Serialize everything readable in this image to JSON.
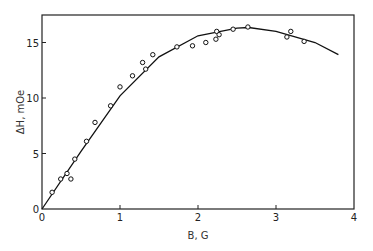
{
  "chart_data": {
    "type": "scatter",
    "title": "",
    "xlabel": "B, G",
    "ylabel": "ΔH, mOe",
    "xlim": [
      0,
      4
    ],
    "ylim": [
      0,
      17
    ],
    "xticks": [
      0,
      1,
      2,
      3,
      4
    ],
    "yticks": [
      0,
      5,
      10,
      15
    ],
    "xtick_labels": [
      "0",
      "1",
      "2",
      "3",
      "4"
    ],
    "ytick_labels": [
      "0",
      "5",
      "10",
      "15"
    ],
    "grid": false,
    "legend": null,
    "series": [
      {
        "name": "measured",
        "kind": "scatter",
        "marker": "open-circle",
        "x": [
          0.13,
          0.24,
          0.32,
          0.37,
          0.42,
          0.57,
          0.68,
          0.88,
          1.0,
          1.16,
          1.29,
          1.33,
          1.42,
          1.73,
          1.93,
          2.1,
          2.23,
          2.24,
          2.27,
          2.45,
          2.64,
          3.14,
          3.19,
          3.36
        ],
        "y": [
          1.5,
          2.7,
          3.2,
          2.7,
          4.5,
          6.1,
          7.8,
          9.3,
          11.0,
          12.0,
          13.2,
          12.6,
          13.9,
          14.6,
          14.7,
          15.0,
          15.3,
          16.0,
          15.7,
          16.2,
          16.4,
          15.5,
          16.0,
          15.1
        ]
      },
      {
        "name": "fit",
        "kind": "line",
        "x": [
          0,
          0.5,
          1.0,
          1.5,
          2.0,
          2.5,
          2.65,
          3.0,
          3.5,
          3.8
        ],
        "y": [
          0,
          5.2,
          10.2,
          13.7,
          15.6,
          16.3,
          16.35,
          16.0,
          15.0,
          13.9
        ]
      }
    ]
  }
}
